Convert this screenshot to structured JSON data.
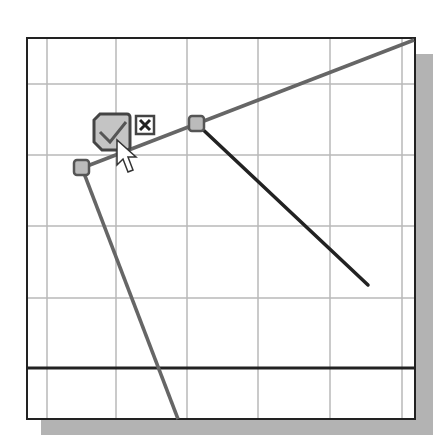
{
  "sketch": {
    "grid": {
      "vertical_x": [
        47,
        116,
        187,
        258,
        330,
        402
      ],
      "horizontal_y": [
        84,
        155,
        226,
        298
      ],
      "color": "#b0b0b0"
    },
    "frame": {
      "x": 26,
      "y": 37,
      "width": 390,
      "height": 383,
      "border_color": "#222222",
      "shadow_color": "#b3b3b3"
    },
    "lines": [
      {
        "name": "gray-line-top",
        "x1": 82,
        "y1": 168,
        "x2": 414,
        "y2": 40,
        "color": "#666666",
        "width": 3
      },
      {
        "name": "dark-line-diagonal",
        "x1": 197,
        "y1": 124,
        "x2": 368,
        "y2": 285,
        "color": "#222222",
        "width": 3
      },
      {
        "name": "gray-line-left",
        "x1": 82,
        "y1": 168,
        "x2": 178,
        "y2": 420,
        "color": "#666666",
        "width": 3
      },
      {
        "name": "dark-horizontal-line",
        "x1": 26,
        "y1": 368,
        "x2": 416,
        "y2": 368,
        "color": "#222222",
        "width": 3
      }
    ],
    "endpoints": [
      {
        "name": "endpoint-left",
        "x": 82,
        "y": 168
      },
      {
        "name": "endpoint-middle",
        "x": 197,
        "y": 124
      }
    ],
    "confirm_widget": {
      "accept_icon": "checkmark-icon",
      "reject_icon": "close-icon"
    },
    "cursor": "arrow-cursor-icon"
  }
}
